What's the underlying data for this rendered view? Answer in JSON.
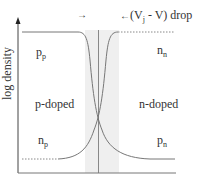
{
  "diagram": {
    "y_axis_label": "log density",
    "regions": {
      "left": "p-doped",
      "right": "n-doped"
    },
    "carrier_labels": {
      "p_p": {
        "main": "p",
        "sub": "p"
      },
      "n_n": {
        "main": "n",
        "sub": "n"
      },
      "n_p": {
        "main": "n",
        "sub": "p"
      },
      "p_n": {
        "main": "p",
        "sub": "n"
      }
    },
    "annotation": {
      "left_arrow": "→",
      "right_arrow": "←",
      "prefix": "(V",
      "sub": "j",
      "suffix": " - V) drop"
    },
    "colors": {
      "axis": "#333333",
      "curve": "#777777",
      "depletion_band": "#ededed",
      "junction_line": "#888888"
    }
  }
}
